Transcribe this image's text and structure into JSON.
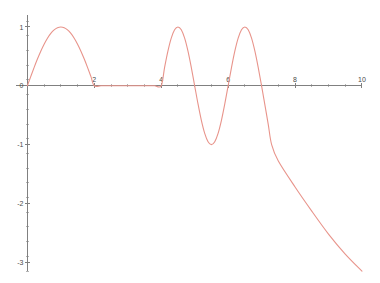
{
  "figure": {
    "width": 380,
    "height": 283,
    "background_color": "#ffffff",
    "title": "",
    "has_frame": false
  },
  "chart_data": {
    "type": "line",
    "title": "",
    "subtitle": "",
    "xlabel": "",
    "ylabel": "",
    "xlim": [
      -0.4,
      10.3
    ],
    "ylim": [
      -3.25,
      1.22
    ],
    "grid": false,
    "legend": false,
    "legend_position": "none",
    "axis_color": "#808080",
    "series": [
      {
        "name": "curve",
        "color": "#e8948b",
        "linewidth": 1.1,
        "description": "Piecewise wave: one positive sine arch on [0,2], zero on [2,4], one full oscillation on [4,7.3], then steep linear decay to -3.15 at x=10",
        "x": [
          0.0,
          0.1,
          0.2,
          0.3,
          0.4,
          0.5,
          0.6,
          0.7,
          0.8,
          0.9,
          1.0,
          1.1,
          1.2,
          1.3,
          1.4,
          1.5,
          1.6,
          1.7,
          1.8,
          1.9,
          2.0,
          2.2,
          2.4,
          2.6,
          2.8,
          3.0,
          3.2,
          3.4,
          3.6,
          3.8,
          4.0,
          4.1,
          4.2,
          4.3,
          4.4,
          4.5,
          4.6,
          4.7,
          4.8,
          4.9,
          5.0,
          5.1,
          5.2,
          5.3,
          5.4,
          5.5,
          5.6,
          5.7,
          5.8,
          5.9,
          6.0,
          6.1,
          6.2,
          6.3,
          6.4,
          6.5,
          6.6,
          6.7,
          6.8,
          6.9,
          7.0,
          7.1,
          7.2,
          7.3,
          7.5,
          8.0,
          8.5,
          9.0,
          9.5,
          10.0
        ],
        "y": [
          0.0,
          0.156,
          0.309,
          0.454,
          0.588,
          0.707,
          0.809,
          0.891,
          0.951,
          0.988,
          1.0,
          0.988,
          0.951,
          0.891,
          0.809,
          0.707,
          0.588,
          0.454,
          0.309,
          0.156,
          0.0,
          0.0,
          0.0,
          0.0,
          0.0,
          0.0,
          0.0,
          0.0,
          0.0,
          0.0,
          0.0,
          0.309,
          0.588,
          0.809,
          0.951,
          1.0,
          0.951,
          0.809,
          0.588,
          0.309,
          0.0,
          -0.309,
          -0.588,
          -0.809,
          -0.951,
          -1.0,
          -0.951,
          -0.809,
          -0.588,
          -0.309,
          0.0,
          0.309,
          0.588,
          0.809,
          0.951,
          1.0,
          0.951,
          0.809,
          0.588,
          0.309,
          0.0,
          -0.33,
          -0.66,
          -1.0,
          -1.28,
          -1.72,
          -2.13,
          -2.52,
          -2.86,
          -3.15
        ]
      }
    ],
    "x_axis": {
      "major_ticks": [
        0,
        2,
        4,
        6,
        8,
        10
      ],
      "major_tick_labels": [
        "0",
        "2",
        "4",
        "6",
        "8",
        "10"
      ],
      "minor_tick_interval": 0.5,
      "axis_start": 0,
      "axis_end": 10
    },
    "y_axis": {
      "major_ticks": [
        1,
        0,
        -1,
        -2,
        -3
      ],
      "major_tick_labels": [
        "1",
        "0",
        "-1",
        "-2",
        "-3"
      ],
      "minor_tick_interval": 0.25,
      "axis_start": 1.2,
      "axis_end": -3.15
    }
  }
}
